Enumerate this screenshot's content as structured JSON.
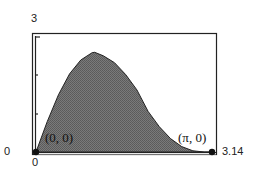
{
  "chart_data": {
    "type": "area",
    "title": "",
    "xlabel": "",
    "ylabel": "",
    "xlim": [
      0,
      3.14
    ],
    "ylim": [
      0,
      3
    ],
    "grid": false,
    "legend": null,
    "function_estimate": "y = 2 sin(x)(1 + cos x)",
    "x": [
      0,
      0.2,
      0.4,
      0.6,
      0.8,
      1.0,
      1.047,
      1.2,
      1.4,
      1.6,
      1.8,
      2.0,
      2.2,
      2.4,
      2.6,
      2.8,
      3.0,
      3.14
    ],
    "y": [
      0,
      0.79,
      1.49,
      2.04,
      2.4,
      2.59,
      2.6,
      2.51,
      2.33,
      2.02,
      1.62,
      1.06,
      0.66,
      0.35,
      0.14,
      0.03,
      0.0,
      0
    ],
    "x_ticks": [
      "0",
      "3.14"
    ],
    "y_ticks": [
      "0",
      "3"
    ],
    "annotations": [
      {
        "text": "(0, 0)",
        "x": 0,
        "y": 0
      },
      {
        "text": "(π, 0)",
        "x": 3.14,
        "y": 0
      }
    ],
    "points": [
      {
        "x": 0,
        "y": 0
      },
      {
        "x": 3.14,
        "y": 0
      }
    ],
    "fill_color": "#6b6b6b"
  },
  "labels": {
    "y_max": "3",
    "y_min": "0",
    "x_min": "0",
    "x_max": "3.14",
    "origin_point": "(0, 0)",
    "end_point": "(π, 0)"
  }
}
